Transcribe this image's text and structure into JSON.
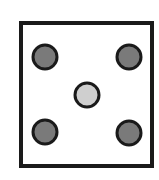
{
  "diagram": {
    "frame": {
      "x": 21,
      "y": 23,
      "width": 131,
      "height": 143,
      "stroke": "#1a1a1a",
      "stroke_width": 4,
      "fill": "#ffffff"
    },
    "circles": [
      {
        "id": "top-left",
        "cx": 45,
        "cy": 57,
        "r": 12,
        "fill": "#7a7a7a"
      },
      {
        "id": "top-right",
        "cx": 129,
        "cy": 57,
        "r": 12,
        "fill": "#7a7a7a"
      },
      {
        "id": "center",
        "cx": 87,
        "cy": 95,
        "r": 12,
        "fill": "#cfcfcf"
      },
      {
        "id": "bottom-left",
        "cx": 45,
        "cy": 132,
        "r": 12,
        "fill": "#7a7a7a"
      },
      {
        "id": "bottom-right",
        "cx": 129,
        "cy": 133,
        "r": 12,
        "fill": "#7a7a7a"
      }
    ],
    "circle_stroke": "#1a1a1a",
    "circle_stroke_width": 3
  }
}
